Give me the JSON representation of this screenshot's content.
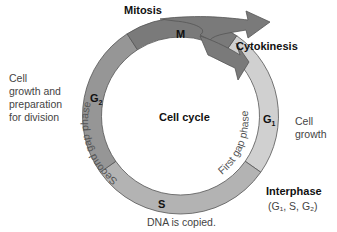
{
  "title": "Cell cycle",
  "phases": {
    "M": {
      "label": "M",
      "name": "Mitosis",
      "color": "#7a7a7a"
    },
    "G1": {
      "label": "G",
      "sub": "1",
      "arc_text": "First gap phase",
      "color": "#d0d0d0"
    },
    "S": {
      "label": "S",
      "color": "#b3b3b3"
    },
    "G2": {
      "label": "G",
      "sub": "2",
      "arc_text": "Second gap phase",
      "color": "#969696"
    }
  },
  "annotations": {
    "mitosis": "Mitosis",
    "cytokinesis": "Cytokinesis",
    "g2_desc": [
      "Cell",
      "growth and",
      "preparation",
      "for division"
    ],
    "g1_desc": [
      "Cell",
      "growth"
    ],
    "s_desc": "DNA is copied.",
    "interphase": "Interphase",
    "interphase_sub": "(G₁, S, G₂)"
  }
}
